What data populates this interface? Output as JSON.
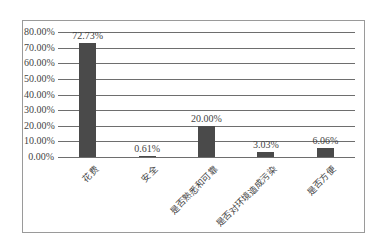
{
  "chart_data": {
    "type": "bar",
    "title": "",
    "xlabel": "",
    "ylabel": "",
    "categories": [
      "花费",
      "安全",
      "是否熟悉和可靠",
      "是否对环境造成污染",
      "是否方便"
    ],
    "values": [
      72.73,
      0.61,
      20.0,
      3.03,
      6.06
    ],
    "value_labels": [
      "72.73%",
      "0.61%",
      "20.00%",
      "3.03%",
      "6.06%"
    ],
    "ylim": [
      0,
      80
    ],
    "yticks": [
      "0.00%",
      "10.00%",
      "20.00%",
      "30.00%",
      "40.00%",
      "50.00%",
      "60.00%",
      "70.00%",
      "80.00%"
    ],
    "grid": true,
    "legend": "none",
    "bar_color": "#4a4a4a"
  }
}
